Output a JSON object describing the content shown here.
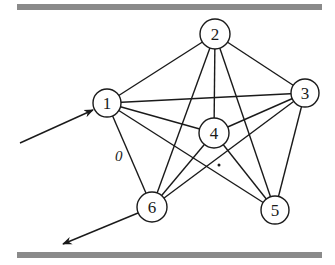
{
  "diagram": {
    "type": "graph",
    "colors": {
      "bar": "#8a8a8a",
      "stroke": "#1a1a1a",
      "background": "#ffffff"
    },
    "bars": [
      {
        "id": "top-bar",
        "x1": 17,
        "x2": 322,
        "y": 4,
        "height": 6
      },
      {
        "id": "bottom-bar",
        "x1": 17,
        "x2": 322,
        "y": 252,
        "height": 6
      }
    ],
    "nodes": [
      {
        "id": "1",
        "label": "1",
        "x": 107,
        "y": 103,
        "r": 14
      },
      {
        "id": "2",
        "label": "2",
        "x": 215,
        "y": 34,
        "r": 15
      },
      {
        "id": "3",
        "label": "3",
        "x": 305,
        "y": 93,
        "r": 14
      },
      {
        "id": "4",
        "label": "4",
        "x": 214,
        "y": 133,
        "r": 15
      },
      {
        "id": "5",
        "label": "5",
        "x": 275,
        "y": 210,
        "r": 14
      },
      {
        "id": "6",
        "label": "6",
        "x": 152,
        "y": 207,
        "r": 15
      }
    ],
    "edges": [
      {
        "from": "1",
        "to": "2"
      },
      {
        "from": "1",
        "to": "3"
      },
      {
        "from": "1",
        "to": "4"
      },
      {
        "from": "1",
        "to": "5"
      },
      {
        "from": "1",
        "to": "6",
        "label": "0"
      },
      {
        "from": "2",
        "to": "3"
      },
      {
        "from": "2",
        "to": "4"
      },
      {
        "from": "2",
        "to": "5"
      },
      {
        "from": "2",
        "to": "6"
      },
      {
        "from": "3",
        "to": "4"
      },
      {
        "from": "3",
        "to": "5"
      },
      {
        "from": "3",
        "to": "6"
      },
      {
        "from": "4",
        "to": "5"
      },
      {
        "from": "4",
        "to": "6"
      }
    ],
    "edge_label": {
      "text": "0",
      "x": 120,
      "y": 161
    },
    "dot": {
      "x": 219,
      "y": 165,
      "r": 1.5
    },
    "arrows": [
      {
        "id": "input-arrow",
        "x1": 20,
        "y1": 143,
        "x2": 93,
        "y2": 110,
        "target": "1"
      },
      {
        "id": "output-arrow",
        "x1": 138,
        "y1": 213,
        "x2": 63,
        "y2": 244,
        "source": "6"
      }
    ]
  }
}
